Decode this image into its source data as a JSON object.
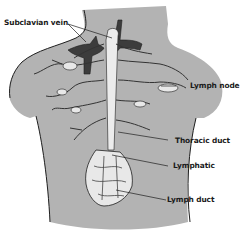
{
  "diagram": {
    "labels": [
      {
        "id": "subclavian-vein",
        "text": "Subclavian vein"
      },
      {
        "id": "lymph-node",
        "text": "Lymph node"
      },
      {
        "id": "thoracic-duct",
        "text": "Thoracic duct"
      },
      {
        "id": "lymphatic",
        "text": "Lymphatic"
      },
      {
        "id": "lymph-duct",
        "text": "Lymph duct"
      }
    ],
    "colors": {
      "body_fill": "#b3b3b3",
      "vessel_fill": "#e8e8e8",
      "vein_fill": "#3c3c3c",
      "outline": "#1e1e1e",
      "background": "#ffffff"
    }
  }
}
